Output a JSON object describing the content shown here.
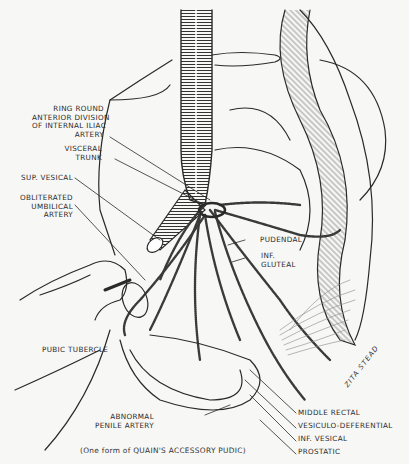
{
  "figure": {
    "caption": "(One form of QUAIN'S ACCESSORY PUDIC)",
    "artist_signature": "ZITA STEAD",
    "labels_left": [
      {
        "id": "ring-round",
        "text": "RING ROUND\nANTERIOR DIVISION\nOF INTERNAL ILIAC\nARTERY"
      },
      {
        "id": "visceral-trunk",
        "text": "VISCERAL\nTRUNK"
      },
      {
        "id": "sup-vesical",
        "text": "SUP. VESICAL"
      },
      {
        "id": "obliterated-umbilical",
        "text": "OBLITERATED\nUMBILICAL\nARTERY"
      },
      {
        "id": "pubic-tubercle",
        "text": "PUBIC TUBERCLE"
      },
      {
        "id": "abnormal-penile",
        "text": "ABNORMAL\nPENILE ARTERY"
      }
    ],
    "labels_right": [
      {
        "id": "pudendal",
        "text": "PUDENDAL"
      },
      {
        "id": "inf-gluteal",
        "text": "INF.\nGLUTEAL"
      },
      {
        "id": "middle-rectal",
        "text": "MIDDLE RECTAL"
      },
      {
        "id": "vesiculo-deferential",
        "text": "VESICULO-DEFERENTIAL"
      },
      {
        "id": "inf-vesical",
        "text": "INF. VESICAL"
      },
      {
        "id": "prostatic",
        "text": "PROSTATIC"
      }
    ],
    "colors": {
      "background": "#f7f7f5",
      "ink": "#2a2a2a"
    }
  }
}
